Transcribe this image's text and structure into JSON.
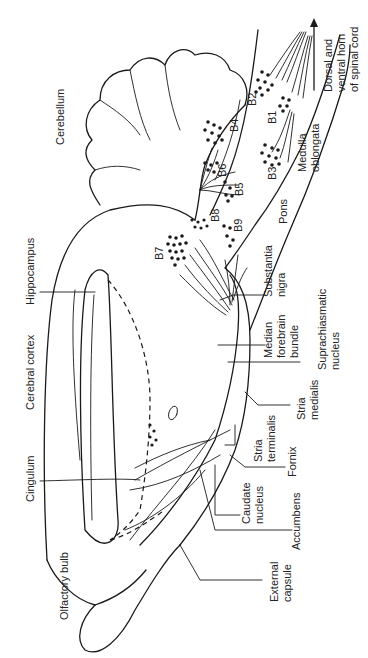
{
  "diagram": {
    "type": "neuroanatomy-schematic",
    "orientation": "rotated-90-ccw",
    "labels": {
      "cerebellum": "Cerebellum",
      "hippocampus": "Hippocampus",
      "cerebral_cortex": "Cerebral cortex",
      "cingulum": "Cingulum",
      "olfactory_bulb": "Olfactory bulb",
      "external_capsule_1": "External",
      "external_capsule_2": "capsule",
      "accumbens": "Accumbens",
      "caudate_1": "Caudate",
      "caudate_2": "nucleus",
      "fornix": "Fornix",
      "stria_terminalis_1": "Stria",
      "stria_terminalis_2": "terminalis",
      "stria_medialis_1": "Stria",
      "stria_medialis_2": "medialis",
      "suprachiasmatic_1": "Suprachiasmatic",
      "suprachiasmatic_2": "nucleus",
      "mfb_1": "Median",
      "mfb_2": "forebrain",
      "mfb_3": "bundle",
      "substantia_1": "Substantia",
      "substantia_2": "nigra",
      "pons": "Pons",
      "medulla_1": "Medulla",
      "medulla_2": "oblongata",
      "spinal_1": "Dorsal and",
      "spinal_2": "ventral horn",
      "spinal_3": "of spinal cord"
    },
    "nuclei": [
      "B1",
      "B2",
      "B3",
      "B4",
      "B5",
      "B6",
      "B7",
      "B8",
      "B9"
    ]
  }
}
